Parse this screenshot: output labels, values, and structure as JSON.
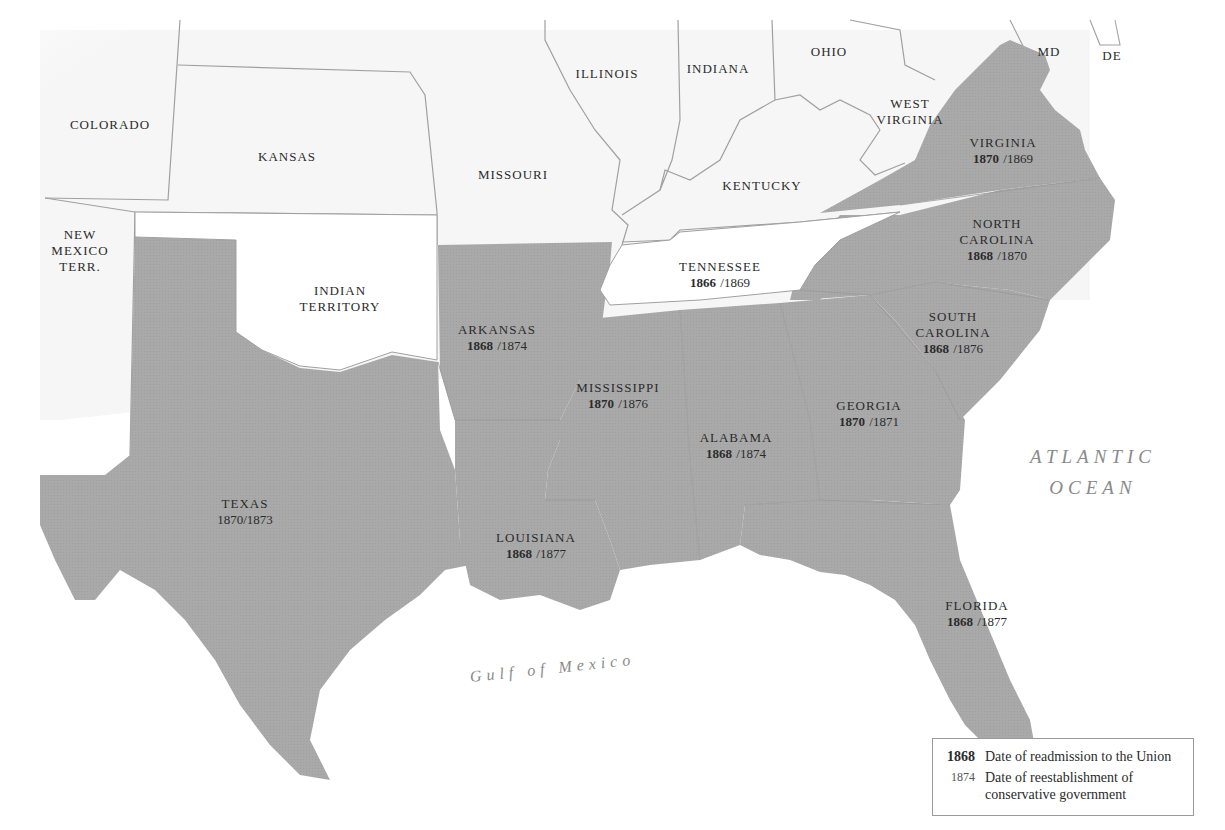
{
  "map": {
    "colors": {
      "confederate_fill": "#a7a7a7",
      "other_fill": "#ffffff",
      "border": "#9a9a9a",
      "text": "#2b2b2b",
      "ocean_text": "#8a8a8a"
    },
    "other_regions": [
      {
        "name": "COLORADO"
      },
      {
        "name": "KANSAS"
      },
      {
        "name": "NEW MEXICO TERR.",
        "lines": [
          "NEW",
          "MEXICO",
          "TERR."
        ]
      },
      {
        "name": "INDIAN TERRITORY",
        "lines": [
          "INDIAN",
          "TERRITORY"
        ]
      },
      {
        "name": "MISSOURI"
      },
      {
        "name": "ILLINOIS"
      },
      {
        "name": "INDIANA"
      },
      {
        "name": "OHIO"
      },
      {
        "name": "KENTUCKY"
      },
      {
        "name": "WEST VIRGINIA",
        "lines": [
          "WEST",
          "VIRGINIA"
        ]
      },
      {
        "name": "MD"
      },
      {
        "name": "DE"
      }
    ],
    "states": [
      {
        "name": "VIRGINIA",
        "lines": [
          "VIRGINIA"
        ],
        "readmitted": "1870",
        "conservative": "/1869"
      },
      {
        "name": "NORTH CAROLINA",
        "lines": [
          "NORTH",
          "CAROLINA"
        ],
        "readmitted": "1868",
        "conservative": "/1870"
      },
      {
        "name": "SOUTH CAROLINA",
        "lines": [
          "SOUTH",
          "CAROLINA"
        ],
        "readmitted": "1868",
        "conservative": "/1876"
      },
      {
        "name": "TENNESSEE",
        "lines": [
          "TENNESSEE"
        ],
        "readmitted": "1866",
        "conservative": "/1869"
      },
      {
        "name": "ARKANSAS",
        "lines": [
          "ARKANSAS"
        ],
        "readmitted": "1868",
        "conservative": "/1874"
      },
      {
        "name": "MISSISSIPPI",
        "lines": [
          "MISSISSIPPI"
        ],
        "readmitted": "1870",
        "conservative": "/1876"
      },
      {
        "name": "GEORGIA",
        "lines": [
          "GEORGIA"
        ],
        "readmitted": "1870",
        "conservative": "/1871"
      },
      {
        "name": "ALABAMA",
        "lines": [
          "ALABAMA"
        ],
        "readmitted": "1868",
        "conservative": "/1874"
      },
      {
        "name": "TEXAS",
        "lines": [
          "TEXAS"
        ],
        "readmitted": "1870",
        "conservative": "/1873"
      },
      {
        "name": "LOUISIANA",
        "lines": [
          "LOUISIANA"
        ],
        "readmitted": "1868",
        "conservative": "/1877"
      },
      {
        "name": "FLORIDA",
        "lines": [
          "FLORIDA"
        ],
        "readmitted": "1868",
        "conservative": "/1877"
      }
    ],
    "water": {
      "atlantic": [
        "ATLANTIC",
        "OCEAN"
      ],
      "gulf": "Gulf of Mexico"
    },
    "legend": {
      "items": [
        {
          "key": "1868",
          "description": "Date of readmission to the Union"
        },
        {
          "key": "1874",
          "description": "Date of reestablishment of",
          "description2": "conservative government"
        }
      ]
    }
  }
}
